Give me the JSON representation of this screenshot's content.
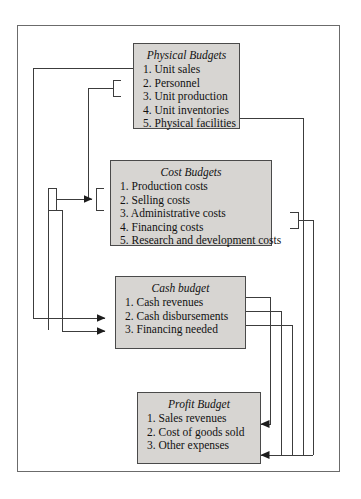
{
  "diagram": {
    "frame_color": "#6b6b6b",
    "box_fill": "#d7d5d2",
    "box_border": "#4a4a4a",
    "line_color": "#3c3c3c",
    "nodes": [
      {
        "id": "physical",
        "title": "Physical Budgets",
        "items": [
          "1. Unit sales",
          "2. Personnel",
          "3. Unit production",
          "4. Unit inventories",
          "5. Physical facilities"
        ]
      },
      {
        "id": "cost",
        "title": "Cost Budgets",
        "items": [
          "1. Production costs",
          "2. Selling costs",
          "3. Administrative costs",
          "4. Financing costs",
          "5. Research and development costs"
        ]
      },
      {
        "id": "cash",
        "title": "Cash budget",
        "items": [
          "1. Cash revenues",
          "2. Cash disbursements",
          "3. Financing needed"
        ]
      },
      {
        "id": "profit",
        "title": "Profit Budget",
        "items": [
          "1. Sales revenues",
          "2. Cost of goods sold",
          "3. Other expenses"
        ]
      }
    ]
  }
}
